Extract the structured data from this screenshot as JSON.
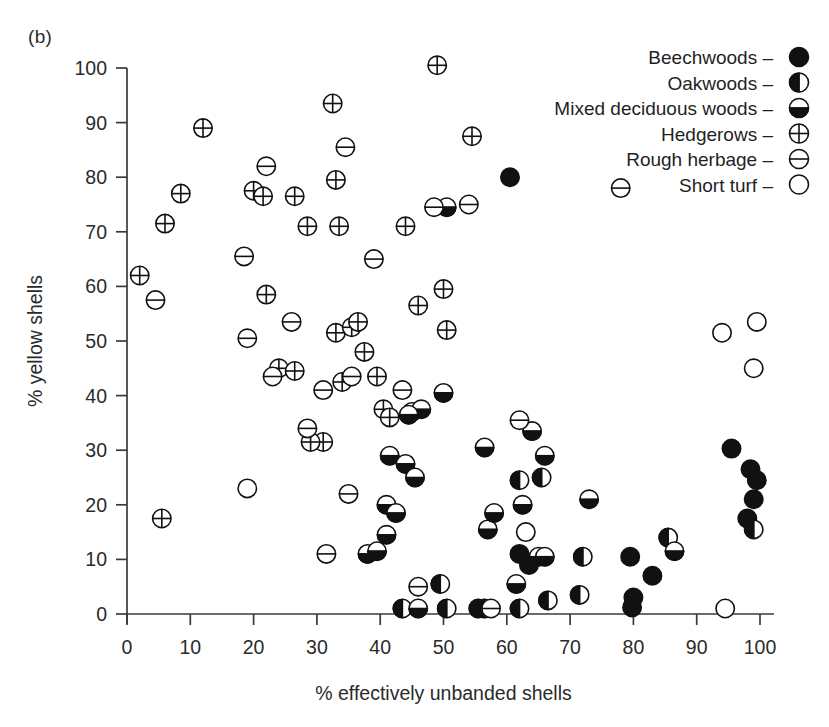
{
  "figure": {
    "panel_label": "(b)"
  },
  "chart_data": {
    "type": "scatter",
    "title": "",
    "xlabel": "% effectively unbanded shells",
    "ylabel": "% yellow shells",
    "xlim": [
      0,
      100
    ],
    "ylim": [
      0,
      100
    ],
    "xticks": [
      0,
      10,
      20,
      30,
      40,
      50,
      60,
      70,
      80,
      90,
      100
    ],
    "yticks": [
      0,
      10,
      20,
      30,
      40,
      50,
      60,
      70,
      80,
      90,
      100
    ],
    "grid": false,
    "legend_position": "top-right",
    "legend_separator": "–",
    "series": [
      {
        "name": "Beechwoods",
        "marker": "filled-circle",
        "points": [
          [
            60.5,
            80.0
          ],
          [
            95.5,
            30.3
          ],
          [
            98.5,
            26.5
          ],
          [
            99.5,
            24.5
          ],
          [
            99.0,
            21.0
          ],
          [
            98.0,
            17.5
          ],
          [
            83.0,
            7.0
          ],
          [
            79.5,
            10.5
          ],
          [
            80.0,
            3.0
          ],
          [
            79.8,
            1.2
          ],
          [
            62.0,
            11.0
          ],
          [
            63.5,
            9.0
          ]
        ]
      },
      {
        "name": "Oakwoods",
        "marker": "left-half-circle",
        "points": [
          [
            49.5,
            5.5
          ],
          [
            43.5,
            1.0
          ],
          [
            50.5,
            1.0
          ],
          [
            55.5,
            1.0
          ],
          [
            56.5,
            1.0
          ],
          [
            62.0,
            1.0
          ],
          [
            62.0,
            24.5
          ],
          [
            65.5,
            25.0
          ],
          [
            66.5,
            2.5
          ],
          [
            71.5,
            3.5
          ],
          [
            72.0,
            10.5
          ],
          [
            85.5,
            14.0
          ],
          [
            99.0,
            15.5
          ]
        ]
      },
      {
        "name": "Mixed deciduous woods",
        "marker": "bottom-half-circle",
        "points": [
          [
            50.0,
            40.5
          ],
          [
            45.0,
            37.0
          ],
          [
            46.5,
            37.5
          ],
          [
            44.5,
            36.5
          ],
          [
            41.5,
            29.0
          ],
          [
            44.0,
            27.5
          ],
          [
            45.5,
            25.0
          ],
          [
            41.0,
            20.0
          ],
          [
            42.5,
            18.5
          ],
          [
            41.0,
            14.5
          ],
          [
            38.0,
            11.0
          ],
          [
            39.5,
            11.5
          ],
          [
            56.5,
            30.5
          ],
          [
            57.0,
            15.5
          ],
          [
            58.0,
            18.5
          ],
          [
            62.5,
            20.0
          ],
          [
            64.0,
            33.5
          ],
          [
            66.0,
            29.0
          ],
          [
            65.0,
            10.5
          ],
          [
            66.0,
            10.5
          ],
          [
            73.0,
            21.0
          ],
          [
            86.5,
            11.5
          ],
          [
            61.5,
            5.5
          ],
          [
            46.0,
            1.0
          ],
          [
            50.5,
            74.5
          ]
        ]
      },
      {
        "name": "Hedgerows",
        "marker": "cross-circle",
        "points": [
          [
            5.5,
            17.5
          ],
          [
            2.0,
            62.0
          ],
          [
            6.0,
            71.5
          ],
          [
            8.5,
            77.0
          ],
          [
            12.0,
            89.0
          ],
          [
            20.0,
            77.5
          ],
          [
            21.5,
            76.5
          ],
          [
            22.0,
            58.5
          ],
          [
            26.5,
            76.5
          ],
          [
            28.5,
            71.0
          ],
          [
            31.0,
            31.5
          ],
          [
            32.5,
            93.5
          ],
          [
            33.0,
            79.5
          ],
          [
            33.5,
            71.0
          ],
          [
            33.0,
            51.5
          ],
          [
            34.0,
            42.5
          ],
          [
            35.5,
            52.5
          ],
          [
            36.5,
            53.5
          ],
          [
            37.5,
            48.0
          ],
          [
            39.5,
            43.5
          ],
          [
            40.5,
            37.5
          ],
          [
            41.5,
            36.0
          ],
          [
            44.0,
            71.0
          ],
          [
            46.0,
            56.5
          ],
          [
            50.0,
            59.5
          ],
          [
            50.5,
            52.0
          ],
          [
            54.5,
            87.5
          ],
          [
            29.0,
            31.5
          ],
          [
            24.0,
            45.0
          ],
          [
            26.5,
            44.5
          ],
          [
            49.0,
            100.5
          ]
        ]
      },
      {
        "name": "Rough herbage",
        "marker": "line-circle",
        "points": [
          [
            4.5,
            57.5
          ],
          [
            18.5,
            65.5
          ],
          [
            19.0,
            50.5
          ],
          [
            22.0,
            82.0
          ],
          [
            23.0,
            43.5
          ],
          [
            26.0,
            53.5
          ],
          [
            28.5,
            34.0
          ],
          [
            31.0,
            41.0
          ],
          [
            31.5,
            11.0
          ],
          [
            34.5,
            85.5
          ],
          [
            35.0,
            22.0
          ],
          [
            35.5,
            43.5
          ],
          [
            39.0,
            65.0
          ],
          [
            43.5,
            41.0
          ],
          [
            46.0,
            5.0
          ],
          [
            48.5,
            74.5
          ],
          [
            54.0,
            75.0
          ],
          [
            57.5,
            1.0
          ],
          [
            62.0,
            35.5
          ],
          [
            78.0,
            78.0
          ]
        ]
      },
      {
        "name": "Short turf",
        "marker": "open-circle",
        "points": [
          [
            19.0,
            23.0
          ],
          [
            63.0,
            15.0
          ],
          [
            94.0,
            51.5
          ],
          [
            94.5,
            1.0
          ],
          [
            99.5,
            53.5
          ],
          [
            99.0,
            45.0
          ]
        ]
      }
    ],
    "legend": [
      {
        "label": "Beechwoods",
        "marker": "filled-circle"
      },
      {
        "label": "Oakwoods",
        "marker": "left-half-circle"
      },
      {
        "label": "Mixed deciduous woods",
        "marker": "bottom-half-circle"
      },
      {
        "label": "Hedgerows",
        "marker": "cross-circle"
      },
      {
        "label": "Rough herbage",
        "marker": "line-circle"
      },
      {
        "label": "Short turf",
        "marker": "open-circle"
      }
    ]
  }
}
